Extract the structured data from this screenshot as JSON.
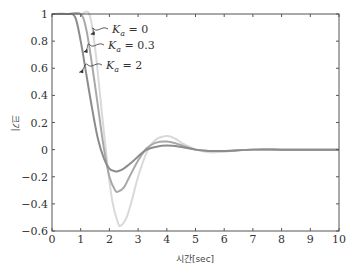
{
  "chart_data": {
    "type": "line",
    "title": "",
    "xlabel": "시간[sec]",
    "ylabel": "크기",
    "xlim": [
      0,
      10
    ],
    "ylim": [
      -0.6,
      1
    ],
    "grid": false,
    "x_ticks": [
      "0",
      "1",
      "2",
      "3",
      "4",
      "5",
      "6",
      "7",
      "8",
      "9",
      "10"
    ],
    "y_ticks": [
      "1",
      "0.8",
      "0.6",
      "0.4",
      "0.2",
      "0",
      "-0.2",
      "-0.4",
      "-0.6"
    ],
    "legend_position": "annotations-upper-left",
    "series": [
      {
        "name": "K_a = 0",
        "label_sym": "K",
        "label_sub": "a",
        "label_val": "= 0",
        "color": "#d9d9d9",
        "x": [
          0,
          0.5,
          1.0,
          1.3,
          1.5,
          1.7,
          1.9,
          2.1,
          2.3,
          2.4,
          2.6,
          2.8,
          3.0,
          3.3,
          3.6,
          4.0,
          4.3,
          4.6,
          5.0,
          5.5,
          6.0,
          6.5,
          7.0,
          8.0,
          9.0,
          10.0
        ],
        "y": [
          1.0,
          1.0,
          1.0,
          1.0,
          0.75,
          0.35,
          -0.05,
          -0.38,
          -0.54,
          -0.56,
          -0.5,
          -0.36,
          -0.2,
          -0.02,
          0.07,
          0.1,
          0.08,
          0.04,
          0.0,
          -0.02,
          -0.015,
          -0.005,
          0.0,
          0.0,
          0.0,
          0.0
        ]
      },
      {
        "name": "K_a = 0.3",
        "label_sym": "K",
        "label_sub": "a",
        "label_val": "= 0.3",
        "color": "#a8a8a8",
        "x": [
          0,
          0.5,
          1.0,
          1.2,
          1.4,
          1.6,
          1.8,
          2.0,
          2.2,
          2.3,
          2.5,
          2.7,
          3.0,
          3.3,
          3.6,
          4.0,
          4.4,
          5.0,
          5.5,
          6.0,
          7.0,
          8.0,
          9.0,
          10.0
        ],
        "y": [
          1.0,
          1.0,
          1.0,
          0.88,
          0.62,
          0.32,
          0.02,
          -0.2,
          -0.3,
          -0.31,
          -0.28,
          -0.2,
          -0.08,
          0.01,
          0.05,
          0.06,
          0.04,
          0.0,
          -0.01,
          -0.01,
          0.0,
          0.0,
          0.0,
          0.0
        ]
      },
      {
        "name": "K_a = 2",
        "label_sym": "K",
        "label_sub": "a",
        "label_val": "= 2",
        "color": "#8c8c8c",
        "x": [
          0,
          0.5,
          0.8,
          1.0,
          1.2,
          1.4,
          1.6,
          1.8,
          2.0,
          2.2,
          2.3,
          2.5,
          2.8,
          3.0,
          3.3,
          3.6,
          4.0,
          4.5,
          5.0,
          5.5,
          6.0,
          7.0,
          8.0,
          9.0,
          10.0
        ],
        "y": [
          1.0,
          1.0,
          0.98,
          0.8,
          0.55,
          0.3,
          0.08,
          -0.06,
          -0.14,
          -0.16,
          -0.16,
          -0.14,
          -0.09,
          -0.05,
          0.0,
          0.02,
          0.03,
          0.02,
          0.0,
          -0.01,
          -0.01,
          0.0,
          0.0,
          0.0,
          0.0
        ]
      }
    ],
    "annotations": [
      {
        "text": "K_a = 0",
        "arrow_to": [
          1.35,
          0.85
        ]
      },
      {
        "text": "K_a = 0.3",
        "arrow_to": [
          1.1,
          0.72
        ]
      },
      {
        "text": "K_a = 2",
        "arrow_to": [
          0.95,
          0.57
        ]
      }
    ]
  }
}
